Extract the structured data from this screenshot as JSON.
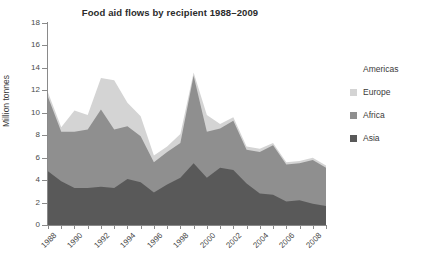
{
  "chart_data": {
    "type": "area",
    "title": "Food aid flows by recipient 1988–2009",
    "xlabel": "",
    "ylabel": "Million tonnes",
    "stacked": true,
    "grid": false,
    "legend_position": "right",
    "ylim": [
      0,
      18
    ],
    "yticks": [
      0,
      2,
      4,
      6,
      8,
      10,
      12,
      14,
      16,
      18
    ],
    "ytick_labels": [
      "0",
      "2",
      "4",
      "6",
      "8",
      "10",
      "12",
      "14",
      "16",
      "18"
    ],
    "xlim": [
      1988,
      2009
    ],
    "xticks": [
      1988,
      1990,
      1992,
      1994,
      1996,
      1998,
      2000,
      2002,
      2004,
      2006,
      2008
    ],
    "xtick_labels": [
      "1988",
      "1990",
      "1992",
      "1994",
      "1996",
      "1998",
      "2000",
      "2002",
      "2004",
      "2006",
      "2008"
    ],
    "x": [
      1988,
      1989,
      1990,
      1991,
      1992,
      1993,
      1994,
      1995,
      1996,
      1997,
      1998,
      1999,
      2000,
      2001,
      2002,
      2003,
      2004,
      2005,
      2006,
      2007,
      2008,
      2009
    ],
    "series": [
      {
        "name": "Asia",
        "color": "#595959",
        "values": [
          4.8,
          3.9,
          3.3,
          3.3,
          3.4,
          3.3,
          4.1,
          3.8,
          2.9,
          3.6,
          4.2,
          5.5,
          4.2,
          5.1,
          4.9,
          3.7,
          2.8,
          2.7,
          2.1,
          2.2,
          1.9,
          1.7
        ]
      },
      {
        "name": "Africa",
        "color": "#8f8f8f",
        "values": [
          6.6,
          4.4,
          5.0,
          5.2,
          6.9,
          5.2,
          4.7,
          4.1,
          2.7,
          2.9,
          3.1,
          7.8,
          4.1,
          3.5,
          4.4,
          3.0,
          3.7,
          4.4,
          3.3,
          3.3,
          3.9,
          3.4
        ]
      },
      {
        "name": "Europe",
        "color": "#d4d4d4",
        "values": [
          0.4,
          0.4,
          1.9,
          1.3,
          2.8,
          4.4,
          2.1,
          1.8,
          0.6,
          0.5,
          0.8,
          0.3,
          1.5,
          0.4,
          0.3,
          0.3,
          0.3,
          0.2,
          0.2,
          0.2,
          0.2,
          0.2
        ]
      },
      {
        "name": "Americas",
        "color": "#ffffff",
        "values": [
          0.7,
          1.1,
          1.6,
          2.0,
          1.8,
          3.6,
          1.7,
          1.2,
          1.0,
          0.9,
          1.0,
          0.9,
          1.1,
          0.9,
          0.9,
          0.9,
          0.8,
          0.8,
          0.7,
          0.7,
          0.7,
          0.6
        ]
      }
    ],
    "legend_entries": [
      {
        "label": "Americas",
        "color": "#ffffff"
      },
      {
        "label": "Europe",
        "color": "#d4d4d4"
      },
      {
        "label": "Africa",
        "color": "#8f8f8f"
      },
      {
        "label": "Asia",
        "color": "#595959"
      }
    ]
  },
  "axis": {
    "y_title": "Million tonnes"
  }
}
